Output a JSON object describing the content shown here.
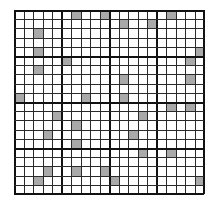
{
  "diagram": {
    "type": "grid",
    "rows": 20,
    "cols": 20,
    "block_size": 5,
    "colors": {
      "background": "#ffffff",
      "line": "#2a2a2a",
      "block_line": "#111111",
      "shade": "#a9a9a9"
    },
    "shaded_cells": [
      [
        0,
        6
      ],
      [
        0,
        9
      ],
      [
        0,
        16
      ],
      [
        1,
        11
      ],
      [
        1,
        14
      ],
      [
        2,
        2
      ],
      [
        4,
        2
      ],
      [
        4,
        19
      ],
      [
        5,
        5
      ],
      [
        5,
        18
      ],
      [
        6,
        2
      ],
      [
        7,
        11
      ],
      [
        7,
        18
      ],
      [
        9,
        0
      ],
      [
        9,
        7
      ],
      [
        9,
        11
      ],
      [
        10,
        16
      ],
      [
        10,
        18
      ],
      [
        11,
        4
      ],
      [
        11,
        13
      ],
      [
        12,
        6
      ],
      [
        13,
        3
      ],
      [
        13,
        12
      ],
      [
        14,
        6
      ],
      [
        15,
        13
      ],
      [
        15,
        16
      ],
      [
        17,
        3
      ],
      [
        17,
        6
      ],
      [
        17,
        9
      ],
      [
        18,
        2
      ],
      [
        18,
        10
      ],
      [
        18,
        19
      ]
    ]
  }
}
